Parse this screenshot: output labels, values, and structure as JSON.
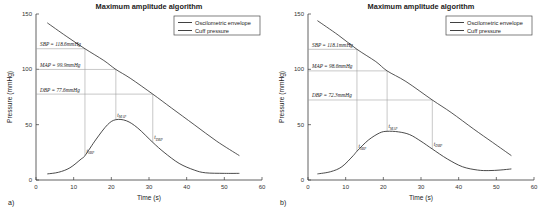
{
  "figure": {
    "panels": [
      {
        "id": "a",
        "panel_label": "a)",
        "title": "Maximum amplitude algorithm",
        "xlabel": "Time (s)",
        "ylabel": "Pressure (mmHg)",
        "legend": [
          {
            "label": "Oscilometric envelope"
          },
          {
            "label": "Cuff pressure"
          }
        ],
        "annotations": [
          {
            "name": "sbp",
            "text": "SBP = 118.6mmHg",
            "value": 118.6,
            "time": 13.0
          },
          {
            "name": "map",
            "text": "MAP = 99.9mmHg",
            "value": 99.9,
            "time": 21.2
          },
          {
            "name": "dbp",
            "text": "DBP = 77.6mmHg",
            "value": 77.6,
            "time": 31.0
          }
        ],
        "time_markers": [
          {
            "name": "t-sbp",
            "base": "t",
            "sub": "SBP",
            "time": 13.0
          },
          {
            "name": "t-map",
            "base": "t",
            "sub": "MAP",
            "time": 21.2
          },
          {
            "name": "t-dbp",
            "base": "t",
            "sub": "DBP",
            "time": 31.0
          }
        ]
      },
      {
        "id": "b",
        "panel_label": "b)",
        "title": "Maximum amplitude algorithm",
        "xlabel": "Time (s)",
        "ylabel": "Pressure (mmHg)",
        "legend": [
          {
            "label": "Oscilometric envelope"
          },
          {
            "label": "Cuff pressure"
          }
        ],
        "annotations": [
          {
            "name": "sbp",
            "text": "SBP = 118.1mmHg",
            "value": 118.1,
            "time": 13.0
          },
          {
            "name": "map",
            "text": "MAP = 98.6mmHg",
            "value": 98.6,
            "time": 21.0
          },
          {
            "name": "dbp",
            "text": "DBP = 72.3mmHg",
            "value": 72.3,
            "time": 33.0
          }
        ],
        "time_markers": [
          {
            "name": "t-sbp",
            "base": "t",
            "sub": "SBP",
            "time": 13.0
          },
          {
            "name": "t-map",
            "base": "t",
            "sub": "MAP",
            "time": 21.0
          },
          {
            "name": "t-dbp",
            "base": "t",
            "sub": "DBP",
            "time": 33.0
          }
        ]
      }
    ]
  },
  "chart_data": [
    {
      "type": "line",
      "panel": "a",
      "title": "Maximum amplitude algorithm",
      "xlabel": "Time (s)",
      "ylabel": "Pressure (mmHg)",
      "xlim": [
        0,
        60
      ],
      "ylim": [
        0,
        150
      ],
      "xticks": [
        0,
        10,
        20,
        30,
        40,
        50,
        60
      ],
      "yticks": [
        0,
        50,
        100,
        150
      ],
      "grid": false,
      "legend_position": "top-right",
      "series": [
        {
          "name": "Cuff pressure",
          "x": [
            3,
            8,
            13,
            18,
            21.2,
            25,
            31,
            36,
            42,
            48,
            54
          ],
          "y": [
            142,
            130,
            118.6,
            108,
            99.9,
            92,
            77.6,
            65,
            50,
            35,
            22
          ]
        },
        {
          "name": "Oscilometric envelope",
          "x": [
            3,
            6,
            9,
            12,
            13,
            16,
            19,
            21.2,
            24,
            27,
            31,
            34,
            38,
            42,
            45,
            50,
            54
          ],
          "y": [
            5.5,
            7,
            11,
            19,
            22,
            37,
            50,
            54.5,
            53.5,
            47,
            34,
            25,
            15,
            9,
            6.5,
            6,
            6
          ]
        }
      ]
    },
    {
      "type": "line",
      "panel": "b",
      "title": "Maximum amplitude algorithm",
      "xlabel": "Time (s)",
      "ylabel": "Pressure (mmHg)",
      "xlim": [
        0,
        60
      ],
      "ylim": [
        0,
        150
      ],
      "xticks": [
        0,
        10,
        20,
        30,
        40,
        50,
        60
      ],
      "yticks": [
        0,
        50,
        100,
        150
      ],
      "grid": false,
      "legend_position": "top-right",
      "series": [
        {
          "name": "Cuff pressure",
          "x": [
            2.5,
            8,
            13,
            18,
            21,
            26,
            33,
            38,
            44,
            49,
            54
          ],
          "y": [
            144,
            131,
            118.1,
            107,
            98.6,
            89,
            72.3,
            61,
            46,
            34,
            22
          ]
        },
        {
          "name": "Oscilometric envelope",
          "x": [
            2.5,
            6,
            9,
            12,
            13,
            16,
            19,
            21,
            24,
            27,
            30,
            33,
            37,
            41,
            45,
            48,
            51,
            54
          ],
          "y": [
            5.5,
            7.5,
            12,
            22,
            26,
            36,
            42.5,
            44,
            43.5,
            41,
            35,
            28,
            19,
            12,
            9,
            8.5,
            9,
            10
          ]
        }
      ]
    }
  ]
}
